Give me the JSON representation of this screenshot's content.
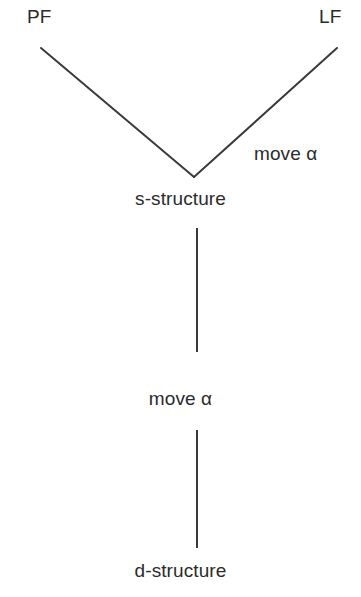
{
  "diagram": {
    "type": "tree-diagram",
    "canvas": {
      "width": 361,
      "height": 597,
      "background": "#ffffff"
    },
    "line_color": "#3a3a3a",
    "text_color": "#2b2b2b",
    "stroke_width": 2,
    "nodes": [
      {
        "id": "pf",
        "label": "PF",
        "x": 41,
        "y": 18
      },
      {
        "id": "lf",
        "label": "LF",
        "x": 335,
        "y": 18
      },
      {
        "id": "s-structure",
        "label": "s-structure",
        "x": 193,
        "y": 199
      },
      {
        "id": "d-structure",
        "label": "d-structure",
        "x": 193,
        "y": 571
      }
    ],
    "edge_labels": [
      {
        "id": "move-alpha-right",
        "label": "move α",
        "x": 296,
        "y": 154
      },
      {
        "id": "move-alpha-mid",
        "label": "move α",
        "x": 193,
        "y": 399
      }
    ],
    "edges": [
      {
        "id": "edge-s-to-pf",
        "from": "s-structure",
        "to": "pf",
        "x1": 194,
        "y1": 177,
        "x2": 41,
        "y2": 48
      },
      {
        "id": "edge-s-to-lf",
        "from": "s-structure",
        "to": "lf",
        "x1": 194,
        "y1": 177,
        "x2": 337,
        "y2": 48
      },
      {
        "id": "edge-s-to-move-alpha",
        "from": "s-structure",
        "to": "move-alpha-mid",
        "x1": 197,
        "y1": 228,
        "x2": 197,
        "y2": 352
      },
      {
        "id": "edge-move-alpha-to-d",
        "from": "move-alpha-mid",
        "to": "d-structure",
        "x1": 197,
        "y1": 430,
        "x2": 197,
        "y2": 548
      }
    ]
  }
}
